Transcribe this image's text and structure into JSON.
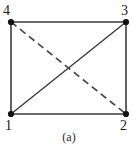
{
  "figure": {
    "caption": "(a)",
    "type": "undirected-graph-quadrilateral",
    "colors": {
      "solid_edge": "#3b3b3b",
      "dashed_edge": "#4a4a4a",
      "vertex": "#111111",
      "label_text": "#1a1a1a",
      "background": "#ffffff"
    },
    "nodes": [
      {
        "id": "1",
        "label": "1",
        "position": "bottom-left",
        "x": 11,
        "y": 114
      },
      {
        "id": "2",
        "label": "2",
        "position": "bottom-right",
        "x": 126,
        "y": 114
      },
      {
        "id": "3",
        "label": "3",
        "position": "top-right",
        "x": 126,
        "y": 22
      },
      {
        "id": "4",
        "label": "4",
        "position": "top-left",
        "x": 11,
        "y": 22
      }
    ],
    "edges": [
      {
        "from": "4",
        "to": "3",
        "style": "solid",
        "kind": "top-edge"
      },
      {
        "from": "1",
        "to": "2",
        "style": "solid",
        "kind": "bottom-edge"
      },
      {
        "from": "4",
        "to": "1",
        "style": "solid",
        "kind": "left-edge"
      },
      {
        "from": "3",
        "to": "2",
        "style": "solid",
        "kind": "right-edge"
      },
      {
        "from": "1",
        "to": "3",
        "style": "solid",
        "kind": "diagonal"
      },
      {
        "from": "4",
        "to": "2",
        "style": "dashed",
        "kind": "diagonal"
      }
    ]
  }
}
